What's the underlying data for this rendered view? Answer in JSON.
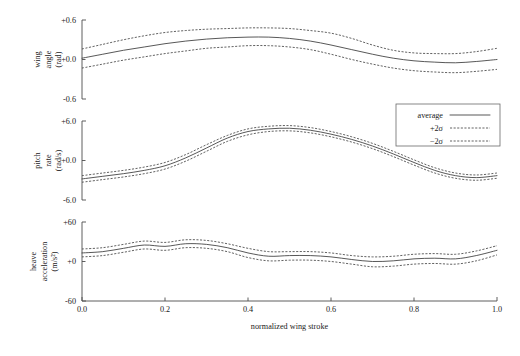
{
  "figure": {
    "type": "multi-panel-line-chart",
    "xlabel": "normalized wing stroke",
    "xlim": [
      0.0,
      1.0
    ],
    "x_ticks": [
      "0.0",
      "0.2",
      "0.4",
      "0.6",
      "0.8",
      "1.0"
    ],
    "x_tick_values": [
      0.0,
      0.2,
      0.4,
      0.6,
      0.8,
      1.0
    ],
    "caption": ""
  },
  "legend": {
    "position": "upper-right",
    "entries": [
      {
        "label": "average",
        "style": "solid"
      },
      {
        "label": "+2σ",
        "style": "dashed"
      },
      {
        "label": "−2σ",
        "style": "dashed"
      }
    ]
  },
  "colors": {
    "curve": "#3a3a3a",
    "axis": "#4d4d4d",
    "text": "#1a1a1a",
    "background": "#ffffff"
  },
  "chart_data": [
    {
      "type": "line",
      "panel": "wing-angle",
      "title": "",
      "xlabel": "",
      "ylabel": "wing angle (rad)",
      "ylabel_lines": [
        "wing",
        "angle",
        "(rad)"
      ],
      "ylim": [
        -0.6,
        0.6
      ],
      "y_ticks": [
        "+0.6",
        "+0.0",
        "-0.6"
      ],
      "y_tick_values": [
        0.6,
        0.0,
        -0.6
      ],
      "grid": false,
      "x": [
        0.0,
        0.05,
        0.1,
        0.15,
        0.2,
        0.25,
        0.3,
        0.35,
        0.4,
        0.45,
        0.5,
        0.55,
        0.6,
        0.65,
        0.7,
        0.75,
        0.8,
        0.85,
        0.9,
        0.95,
        1.0
      ],
      "series": [
        {
          "name": "average",
          "style": "solid",
          "values": [
            0.02,
            0.08,
            0.14,
            0.19,
            0.24,
            0.28,
            0.31,
            0.33,
            0.34,
            0.34,
            0.32,
            0.28,
            0.22,
            0.15,
            0.08,
            0.02,
            -0.02,
            -0.04,
            -0.05,
            -0.03,
            0.0
          ]
        },
        {
          "name": "+2σ",
          "style": "dashed",
          "values": [
            0.16,
            0.23,
            0.3,
            0.36,
            0.41,
            0.44,
            0.46,
            0.47,
            0.48,
            0.48,
            0.47,
            0.44,
            0.4,
            0.32,
            0.22,
            0.14,
            0.1,
            0.09,
            0.09,
            0.12,
            0.17
          ]
        },
        {
          "name": "−2σ",
          "style": "dashed",
          "values": [
            -0.13,
            -0.07,
            -0.01,
            0.04,
            0.09,
            0.13,
            0.17,
            0.19,
            0.21,
            0.21,
            0.19,
            0.15,
            0.08,
            0.0,
            -0.07,
            -0.13,
            -0.17,
            -0.19,
            -0.2,
            -0.18,
            -0.15
          ]
        }
      ]
    },
    {
      "type": "line",
      "panel": "pitch-rate",
      "title": "",
      "xlabel": "",
      "ylabel": "pitch rate (rad/s)",
      "ylabel_lines": [
        "pitch",
        "rate",
        "(rad/s)"
      ],
      "ylim": [
        -6.0,
        6.0
      ],
      "y_ticks": [
        "+6.0",
        "+0.0",
        "-6.0"
      ],
      "y_tick_values": [
        6.0,
        0.0,
        -6.0
      ],
      "grid": false,
      "x": [
        0.0,
        0.05,
        0.1,
        0.15,
        0.2,
        0.25,
        0.3,
        0.35,
        0.4,
        0.45,
        0.5,
        0.55,
        0.6,
        0.65,
        0.7,
        0.75,
        0.8,
        0.85,
        0.9,
        0.95,
        1.0
      ],
      "series": [
        {
          "name": "average",
          "style": "solid",
          "values": [
            -2.8,
            -2.4,
            -2.0,
            -1.5,
            -0.8,
            0.4,
            1.9,
            3.4,
            4.4,
            4.8,
            4.9,
            4.6,
            4.0,
            3.2,
            2.2,
            1.0,
            -0.3,
            -1.5,
            -2.3,
            -2.6,
            -2.3
          ]
        },
        {
          "name": "+2σ",
          "style": "dashed",
          "values": [
            -2.3,
            -1.9,
            -1.5,
            -1.0,
            -0.3,
            0.9,
            2.4,
            3.8,
            4.8,
            5.2,
            5.3,
            5.0,
            4.4,
            3.6,
            2.6,
            1.4,
            0.1,
            -1.1,
            -1.9,
            -2.2,
            -1.9
          ]
        },
        {
          "name": "−2σ",
          "style": "dashed",
          "values": [
            -3.3,
            -2.9,
            -2.5,
            -2.0,
            -1.3,
            -0.1,
            1.4,
            2.9,
            3.9,
            4.4,
            4.5,
            4.2,
            3.6,
            2.8,
            1.8,
            0.6,
            -0.7,
            -1.9,
            -2.7,
            -3.0,
            -2.7
          ]
        }
      ]
    },
    {
      "type": "line",
      "panel": "heave-acceleration",
      "title": "",
      "xlabel": "",
      "ylabel": "heave acceleration (m/s^2)",
      "ylabel_lines": [
        "heave",
        "acceleration",
        "(m/s²)"
      ],
      "ylim": [
        -60,
        60
      ],
      "y_ticks": [
        "+60",
        "+0",
        "-60"
      ],
      "y_tick_values": [
        60,
        0,
        -60
      ],
      "grid": false,
      "x": [
        0.0,
        0.05,
        0.1,
        0.15,
        0.2,
        0.25,
        0.3,
        0.35,
        0.4,
        0.45,
        0.5,
        0.55,
        0.6,
        0.65,
        0.7,
        0.75,
        0.8,
        0.85,
        0.9,
        0.95,
        1.0
      ],
      "series": [
        {
          "name": "average",
          "style": "solid",
          "values": [
            13,
            15,
            20,
            25,
            23,
            27,
            26,
            21,
            13,
            8,
            9,
            9,
            7,
            3,
            0,
            1,
            4,
            5,
            4,
            9,
            17
          ]
        },
        {
          "name": "+2σ",
          "style": "dashed",
          "values": [
            19,
            21,
            26,
            31,
            29,
            33,
            32,
            27,
            20,
            15,
            15,
            15,
            13,
            9,
            7,
            8,
            11,
            12,
            11,
            16,
            24
          ]
        },
        {
          "name": "−2σ",
          "style": "dashed",
          "values": [
            7,
            9,
            14,
            19,
            17,
            21,
            20,
            15,
            6,
            1,
            2,
            2,
            0,
            -4,
            -8,
            -7,
            -4,
            -3,
            -4,
            1,
            10
          ]
        }
      ]
    }
  ]
}
